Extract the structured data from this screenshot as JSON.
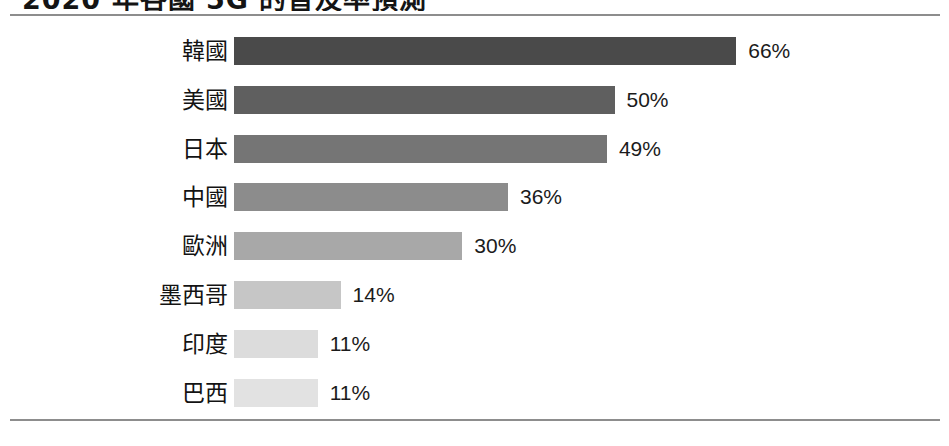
{
  "title": "2020 年各國 5G 的普及率預測",
  "colors": {
    "rule": "#8d8d8d",
    "background": "#ffffff",
    "label_text": "#131313",
    "value_text": "#1b1b1b"
  },
  "chart_data": {
    "type": "bar",
    "orientation": "horizontal",
    "title": "2020 年各國 5G 的普及率預測",
    "xlabel": "",
    "ylabel": "",
    "xlim": [
      0,
      66
    ],
    "grid": false,
    "legend": false,
    "unit": "%",
    "categories": [
      "韓國",
      "美國",
      "日本",
      "中國",
      "歐洲",
      "墨西哥",
      "印度",
      "巴西"
    ],
    "values": [
      66,
      50,
      49,
      36,
      30,
      14,
      11,
      11
    ],
    "value_labels": [
      "66%",
      "50%",
      "49%",
      "36%",
      "30%",
      "14%",
      "11%",
      "11%"
    ],
    "bar_colors": [
      "#4a4a4a",
      "#5f5f5f",
      "#757575",
      "#8c8c8c",
      "#a8a8a8",
      "#c6c6c6",
      "#dcdcdc",
      "#e2e2e2"
    ],
    "bars": [
      {
        "category": "韓國",
        "value": 66,
        "label": "66%",
        "color": "#4a4a4a"
      },
      {
        "category": "美國",
        "value": 50,
        "label": "50%",
        "color": "#5f5f5f"
      },
      {
        "category": "日本",
        "value": 49,
        "label": "49%",
        "color": "#757575"
      },
      {
        "category": "中國",
        "value": 36,
        "label": "36%",
        "color": "#8c8c8c"
      },
      {
        "category": "歐洲",
        "value": 30,
        "label": "30%",
        "color": "#a8a8a8"
      },
      {
        "category": "墨西哥",
        "value": 14,
        "label": "14%",
        "color": "#c6c6c6"
      },
      {
        "category": "印度",
        "value": 11,
        "label": "11%",
        "color": "#dcdcdc"
      },
      {
        "category": "巴西",
        "value": 11,
        "label": "11%",
        "color": "#e2e2e2"
      }
    ]
  }
}
